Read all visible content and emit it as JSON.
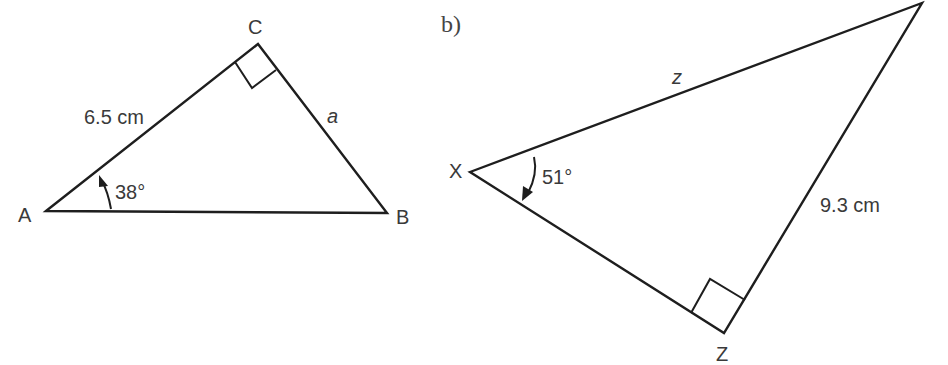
{
  "diagram": {
    "triangle_a": {
      "vertices": {
        "A": "A",
        "B": "B",
        "C": "C"
      },
      "side_ac_label": "6.5 cm",
      "side_cb_label": "a",
      "angle_a_label": "38°",
      "right_angle_at": "C"
    },
    "triangle_b": {
      "part_label": "b)",
      "vertices": {
        "X": "X",
        "Z": "Z"
      },
      "side_xy_label": "z",
      "side_zy_label": "9.3 cm",
      "angle_x_label": "51°",
      "right_angle_at": "Z"
    },
    "colors": {
      "line": "#1e1e1e",
      "text": "#3a3a3a",
      "background": "#ffffff"
    }
  }
}
